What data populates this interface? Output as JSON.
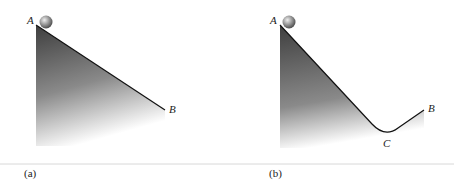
{
  "panels": [
    {
      "caption": "(a)",
      "points": {
        "A": "A",
        "B": "B"
      }
    },
    {
      "caption": "(b)",
      "points": {
        "A": "A",
        "B": "B",
        "C": "C"
      }
    }
  ],
  "colors": {
    "ramp_dark": "#4a4a4a",
    "ramp_light": "#ffffff",
    "line": "#111111",
    "separator": "#cccccc"
  }
}
